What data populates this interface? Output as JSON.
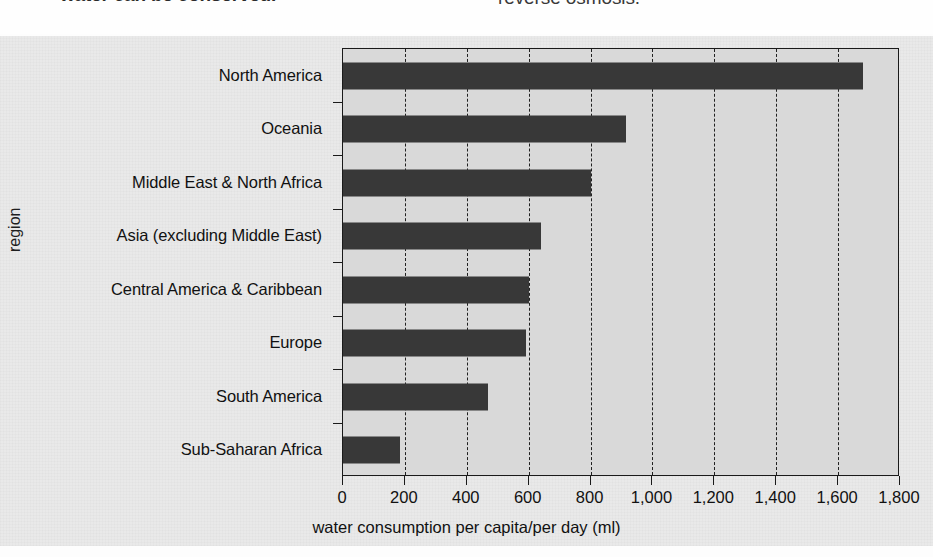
{
  "page": {
    "background_color": "#fdfdfd",
    "figure_background_color": "#e9e9e9"
  },
  "top_text": {
    "left_fragment": "water can be conserved.",
    "right_fragment": "reverse osmosis."
  },
  "chart_data": {
    "type": "bar",
    "orientation": "horizontal",
    "title": "",
    "xlabel": "water consumption per capita/per day (ml)",
    "ylabel": "region",
    "categories": [
      "North America",
      "Oceania",
      "Middle East & North Africa",
      "Asia (excluding Middle East)",
      "Central America & Caribbean",
      "Europe",
      "South America",
      "Sub-Saharan Africa"
    ],
    "values": [
      1680,
      915,
      800,
      640,
      600,
      590,
      470,
      185
    ],
    "xlim": [
      0,
      1800
    ],
    "xticks": [
      0,
      200,
      400,
      600,
      800,
      1000,
      1200,
      1400,
      1600,
      1800
    ],
    "xticklabels": [
      "0",
      "200",
      "400",
      "600",
      "800",
      "1,000",
      "1,200",
      "1,400",
      "1,600",
      "1,800"
    ],
    "grid": "vertical-dashed",
    "legend": "none",
    "bar_color": "#383838",
    "plot_background_color": "#d9d9d9",
    "axis_color": "#1a1a1a"
  }
}
